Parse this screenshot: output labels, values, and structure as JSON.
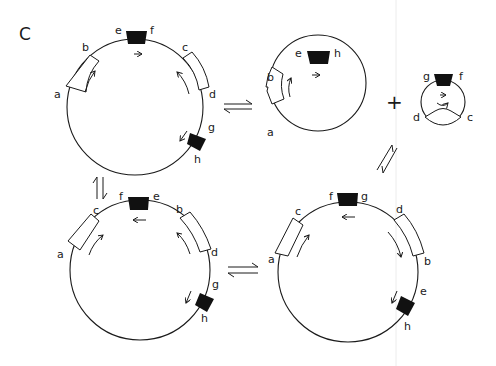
{
  "figure": {
    "panel_label": "C",
    "colors": {
      "stroke": "#1a1a1a",
      "solid_block": "#111111",
      "open_block": "#ffffff",
      "background": "#ffffff",
      "divider": "#e6e6e6"
    },
    "plasmids": [
      {
        "id": "top-left",
        "labels": {
          "a": "a",
          "b": "b",
          "e": "e",
          "f": "f",
          "c": "c",
          "d": "d",
          "g": "g",
          "h": "h"
        }
      },
      {
        "id": "top-middle",
        "labels": {
          "e": "e",
          "h": "h",
          "b": "b",
          "a": "a"
        }
      },
      {
        "id": "small-excised",
        "labels": {
          "g": "g",
          "f": "f",
          "d": "d",
          "c": "c"
        }
      },
      {
        "id": "bottom-left",
        "labels": {
          "c": "c",
          "a": "a",
          "f": "f",
          "e": "e",
          "b": "b",
          "d": "d",
          "g": "g",
          "h": "h"
        }
      },
      {
        "id": "bottom-right",
        "labels": {
          "c": "c",
          "a": "a",
          "f": "f",
          "g": "g",
          "d": "d",
          "b": "b",
          "e": "e",
          "h": "h"
        }
      }
    ],
    "operators": {
      "plus": "+"
    },
    "equilibria": [
      {
        "from": "top-left",
        "to": "top-middle",
        "orientation": "horizontal"
      },
      {
        "from": "top-middle",
        "to": "bottom-right",
        "orientation": "diagonal"
      },
      {
        "from": "top-left",
        "to": "bottom-left",
        "orientation": "vertical"
      },
      {
        "from": "bottom-left",
        "to": "bottom-right",
        "orientation": "horizontal"
      }
    ]
  }
}
